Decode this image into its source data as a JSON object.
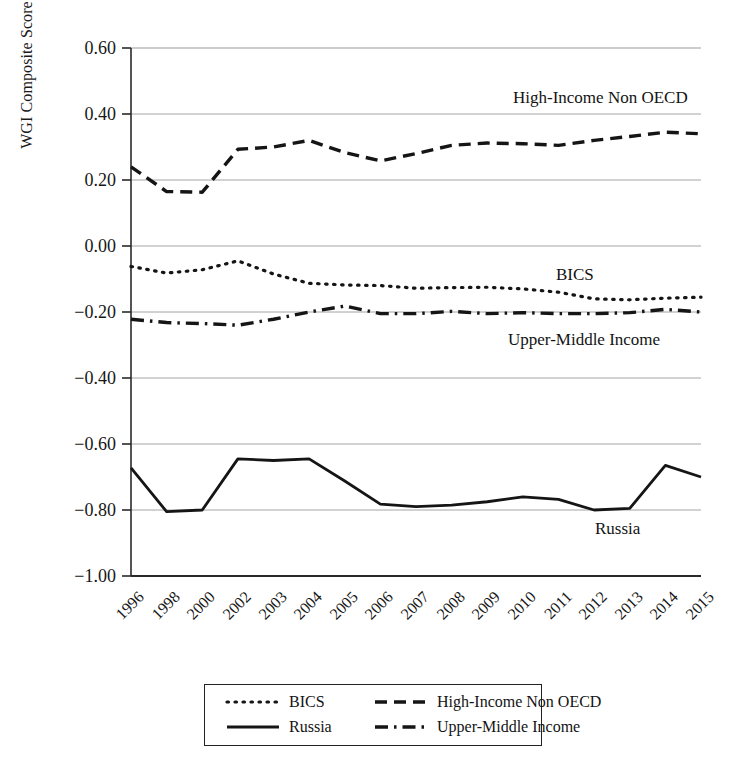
{
  "chart_data": {
    "type": "line",
    "title": "",
    "xlabel": "",
    "ylabel": "WGI Composite Score",
    "ylim": [
      -1.0,
      0.6
    ],
    "yticks": [
      "0.60",
      "0.40",
      "0.20",
      "0.00",
      "−0.20",
      "−0.40",
      "−0.60",
      "−0.80",
      "−1.00"
    ],
    "ytick_values": [
      0.6,
      0.4,
      0.2,
      0.0,
      -0.2,
      -0.4,
      -0.6,
      -0.8,
      -1.0
    ],
    "grid": true,
    "legend_position": "bottom",
    "categories": [
      "1996",
      "1998",
      "2000",
      "2002",
      "2003",
      "2004",
      "2005",
      "2006",
      "2007",
      "2008",
      "2009",
      "2010",
      "2011",
      "2012",
      "2013",
      "2014",
      "2015"
    ],
    "series": [
      {
        "name": "High-Income Non OECD",
        "style": "dashed",
        "color": "#151515",
        "values": [
          0.24,
          0.165,
          0.163,
          0.293,
          0.3,
          0.32,
          0.283,
          0.258,
          0.28,
          0.305,
          0.312,
          0.31,
          0.305,
          0.32,
          0.332,
          0.345,
          0.34
        ]
      },
      {
        "name": "BICS",
        "style": "dotted",
        "color": "#151515",
        "values": [
          -0.062,
          -0.082,
          -0.072,
          -0.045,
          -0.085,
          -0.113,
          -0.118,
          -0.12,
          -0.128,
          -0.126,
          -0.125,
          -0.13,
          -0.14,
          -0.16,
          -0.163,
          -0.158,
          -0.155
        ]
      },
      {
        "name": "Upper-Middle Income",
        "style": "dashdot",
        "color": "#151515",
        "values": [
          -0.222,
          -0.232,
          -0.235,
          -0.24,
          -0.222,
          -0.2,
          -0.182,
          -0.205,
          -0.205,
          -0.198,
          -0.205,
          -0.202,
          -0.205,
          -0.205,
          -0.202,
          -0.192,
          -0.2
        ]
      },
      {
        "name": "Russia",
        "style": "solid",
        "color": "#151515",
        "values": [
          -0.672,
          -0.805,
          -0.8,
          -0.645,
          -0.65,
          -0.645,
          -0.712,
          -0.782,
          -0.79,
          -0.785,
          -0.775,
          -0.76,
          -0.768,
          -0.8,
          -0.795,
          -0.665,
          -0.7
        ]
      }
    ],
    "inline_annotations": [
      {
        "text": "High-Income Non OECD",
        "series": "High-Income Non OECD"
      },
      {
        "text": "BICS",
        "series": "BICS"
      },
      {
        "text": "Upper-Middle Income",
        "series": "Upper-Middle Income"
      },
      {
        "text": "Russia",
        "series": "Russia"
      }
    ]
  },
  "legend": {
    "items": [
      {
        "label": "BICS",
        "style": "dotted"
      },
      {
        "label": "High-Income Non OECD",
        "style": "dashed"
      },
      {
        "label": "Russia",
        "style": "solid"
      },
      {
        "label": "Upper-Middle Income",
        "style": "dashdot"
      }
    ]
  }
}
